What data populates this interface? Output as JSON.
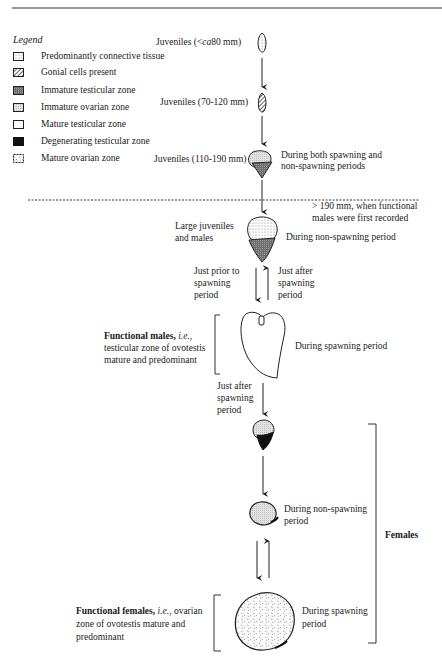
{
  "header": {
    "running_title": "",
    "rule": true
  },
  "legend": {
    "title": "Legend",
    "items": [
      {
        "label": "Predominantly connective tissue",
        "pattern": "dotted-light",
        "icon": "connective-tissue-swatch-icon"
      },
      {
        "label": "Gonial cells present",
        "pattern": "hatched",
        "icon": "gonial-cells-swatch-icon"
      },
      {
        "label": "Immature testicular zone",
        "pattern": "dark-stipple",
        "icon": "immature-testicular-swatch-icon"
      },
      {
        "label": "Immature ovarian zone",
        "pattern": "light-stipple",
        "icon": "immature-ovarian-swatch-icon"
      },
      {
        "label": "Mature testicular zone",
        "pattern": "white",
        "icon": "mature-testicular-swatch-icon"
      },
      {
        "label": "Degenerating testicular zone",
        "pattern": "black",
        "icon": "degenerating-testicular-swatch-icon"
      },
      {
        "label": "Mature ovarian zone",
        "pattern": "coarse-dotted",
        "icon": "mature-ovarian-swatch-icon"
      }
    ]
  },
  "stages": {
    "juv1": {
      "label_pre": "Juveniles (<",
      "label_italic": "ca",
      "label_post": "80 mm)"
    },
    "juv2": {
      "label": "Juveniles (70-120 mm)"
    },
    "juv3": {
      "label": "Juveniles (110-190 mm)",
      "note_line1": "During both spawning and",
      "note_line2": "non-spawning periods"
    },
    "threshold": {
      "line1": "> 190 mm, when functional",
      "line2": "males were first recorded"
    },
    "large_juv": {
      "line1": "Large juveniles",
      "line2": "and males",
      "note": "During non-spawning period"
    },
    "arrows_males": {
      "down": [
        "Just prior to",
        "spawning",
        "period"
      ],
      "up": [
        "Just after",
        "spawning",
        "period"
      ]
    },
    "functional_males": {
      "bold": "Functional males,",
      "italic": "i.e.",
      "rest1": ",",
      "line2": "testicular zone of ovotestis",
      "line3": "mature and predominant",
      "note": "During spawning period"
    },
    "after_spawn": [
      "Just after",
      "spawning",
      "period"
    ],
    "female_nonspawn": {
      "line1": "During non-spawning",
      "line2": "period"
    },
    "females_bracket": "Females",
    "functional_females": {
      "bold": "Functional females,",
      "italic": "i.e.",
      "rest1": ", ovarian",
      "line2": "zone of ovotestis mature and",
      "line3": "predominant",
      "note_line1": "During spawning",
      "note_line2": "period"
    }
  },
  "colors": {
    "ink": "#1a1a1a",
    "dark_stipple": "#7a7a7a",
    "light_stipple": "#d8d8d8",
    "black": "#111111"
  }
}
